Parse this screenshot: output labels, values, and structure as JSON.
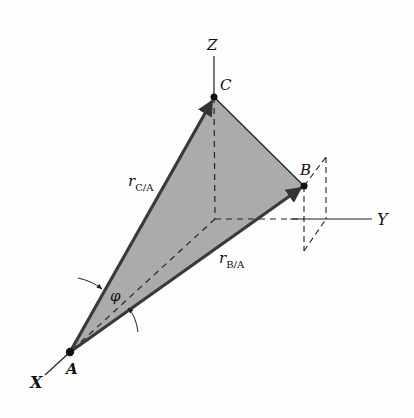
{
  "diagram": {
    "type": "3d-vector-diagram",
    "axes": {
      "x_label": "X",
      "y_label": "Y",
      "z_label": "Z"
    },
    "points": [
      {
        "name": "A",
        "label": "A"
      },
      {
        "name": "B",
        "label": "B"
      },
      {
        "name": "C",
        "label": "C"
      }
    ],
    "vectors": [
      {
        "label_main": "r",
        "label_sub": "C/A",
        "from": "A",
        "to": "C"
      },
      {
        "label_main": "r",
        "label_sub": "B/A",
        "from": "A",
        "to": "B"
      }
    ],
    "angle": {
      "symbol": "φ"
    },
    "colors": {
      "triangle_fill": "#a9a9a9",
      "lines": "#222222",
      "vectors": "#3a3a3a"
    }
  }
}
